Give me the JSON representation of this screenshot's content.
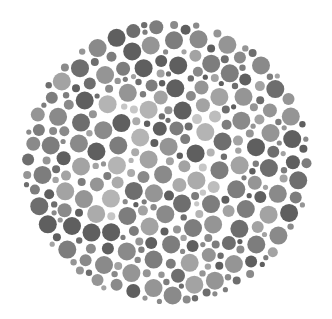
{
  "image": {
    "subject": "Ishihara-style color vision test plate (grayscale)",
    "caption": "Dot-pattern color blindness test plate",
    "background": "#ffffff",
    "plate": {
      "cx": 167,
      "cy": 162,
      "rx": 145,
      "ry": 143
    },
    "dot_colors": [
      "#6e6e6e",
      "#7d7d7d",
      "#8a8a8a",
      "#959595",
      "#a3a3a3",
      "#5f5f5f"
    ],
    "figure_dot_colors": [
      "#b4b4b4",
      "#bdbdbd",
      "#c6c6c6",
      "#ababab"
    ],
    "seed": 7331
  }
}
